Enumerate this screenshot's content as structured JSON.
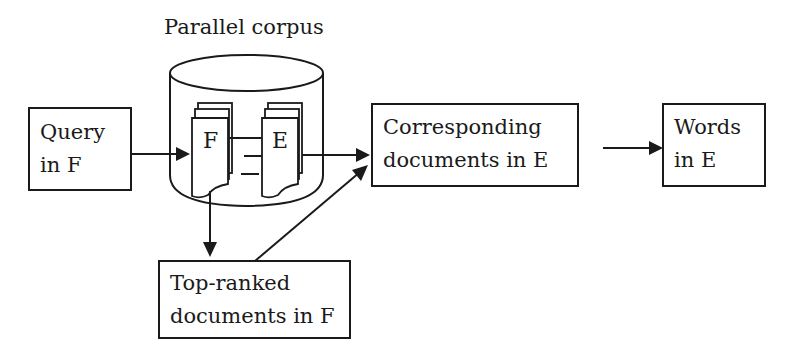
{
  "diagram": {
    "title": "Parallel corpus",
    "nodes": {
      "query": {
        "line1": "Query",
        "line2": "in F"
      },
      "corpus": {
        "label": "Parallel corpus",
        "doc_f": "F",
        "doc_e": "E"
      },
      "corresponding": {
        "line1": "Corresponding",
        "line2": "documents in E"
      },
      "words": {
        "line1": "Words",
        "line2": "in E"
      },
      "top_ranked": {
        "line1": "Top-ranked",
        "line2": "documents in F"
      }
    },
    "edges": [
      {
        "from": "Query in F",
        "to": "F documents (Parallel corpus)"
      },
      {
        "from": "F documents (Parallel corpus)",
        "to": "Top-ranked documents in F"
      },
      {
        "from": "E documents (Parallel corpus)",
        "to": "Corresponding documents in E"
      },
      {
        "from": "Top-ranked documents in F",
        "to": "Corresponding documents in E"
      },
      {
        "from": "Corresponding documents in E",
        "to": "Words in E"
      }
    ],
    "colors": {
      "stroke": "#1a1a1a",
      "background": "#ffffff"
    }
  }
}
